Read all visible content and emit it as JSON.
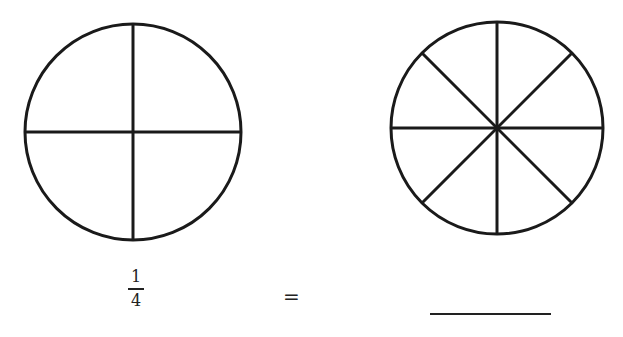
{
  "figure": {
    "left_circle": {
      "label": "circle divided into 4 equal parts",
      "parts": 4
    },
    "right_circle": {
      "label": "circle divided into 8 equal parts",
      "parts": 8
    }
  },
  "equation": {
    "numerator": "1",
    "denominator": "4",
    "equals": "=",
    "answer_blank": ""
  }
}
